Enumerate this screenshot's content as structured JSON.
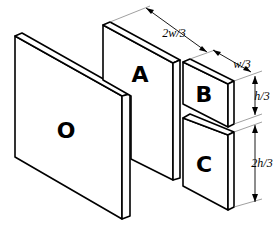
{
  "diagram": {
    "plates": [
      {
        "id": "O",
        "label": "O"
      },
      {
        "id": "A",
        "label": "A"
      },
      {
        "id": "B",
        "label": "B"
      },
      {
        "id": "C",
        "label": "C"
      }
    ],
    "dimensions": {
      "width_A": "2w/3",
      "width_B": "w/3",
      "height_B": "h/3",
      "height_C": "2h/3"
    }
  }
}
